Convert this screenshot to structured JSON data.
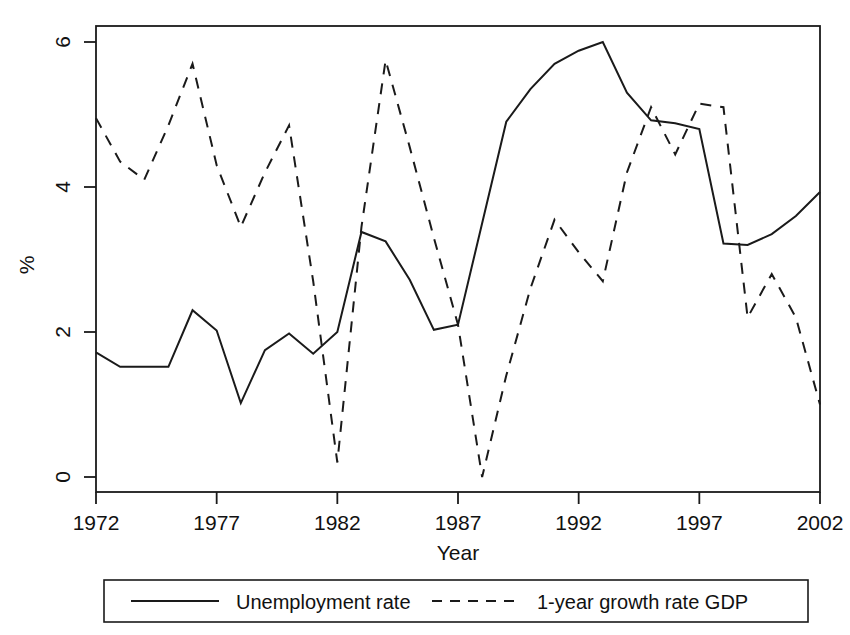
{
  "chart_data": {
    "type": "line",
    "title": "",
    "xlabel": "Year",
    "ylabel": "%",
    "xlim": [
      1972,
      2002
    ],
    "ylim": [
      0,
      6
    ],
    "grid": false,
    "legend_position": "bottom",
    "x_ticks": [
      "1972",
      "1977",
      "1982",
      "1987",
      "1992",
      "1997",
      "2002"
    ],
    "x_tick_values": [
      1972,
      1977,
      1982,
      1987,
      1992,
      1997,
      2002
    ],
    "y_ticks": [
      "0",
      "2",
      "4",
      "6"
    ],
    "y_tick_values": [
      0,
      2,
      4,
      6
    ],
    "x": [
      1972,
      1973,
      1974,
      1975,
      1976,
      1977,
      1978,
      1979,
      1980,
      1981,
      1982,
      1983,
      1984,
      1985,
      1986,
      1987,
      1988,
      1989,
      1990,
      1991,
      1992,
      1993,
      1994,
      1995,
      1996,
      1997,
      1998,
      1999,
      2000,
      2001,
      2002
    ],
    "series": [
      {
        "name": "Unemployment rate",
        "style": "solid",
        "color": "#1a1a1a",
        "values": [
          1.72,
          1.52,
          1.52,
          1.52,
          2.3,
          2.02,
          1.02,
          1.75,
          1.98,
          1.7,
          2.0,
          3.38,
          3.25,
          2.72,
          2.03,
          2.1,
          3.5,
          4.9,
          5.35,
          5.7,
          5.88,
          6.0,
          5.3,
          4.92,
          4.88,
          4.8,
          3.22,
          3.2,
          3.35,
          3.6,
          3.93
        ]
      },
      {
        "name": "1-year growth rate GDP",
        "style": "dashed",
        "color": "#1a1a1a",
        "values": [
          4.95,
          4.35,
          4.1,
          4.85,
          5.7,
          4.3,
          3.45,
          4.2,
          4.85,
          2.7,
          0.2,
          3.45,
          5.75,
          4.55,
          3.3,
          2.1,
          0.0,
          1.4,
          2.6,
          3.55,
          3.1,
          2.7,
          4.2,
          5.1,
          4.45,
          5.15,
          5.1,
          2.2,
          2.8,
          2.2,
          1.0
        ]
      }
    ]
  },
  "legend": {
    "entries": [
      {
        "label": "Unemployment rate",
        "style": "solid"
      },
      {
        "label": "1-year growth rate GDP",
        "style": "dashed"
      }
    ]
  },
  "axes": {
    "x_axis_title": "Year",
    "y_axis_title": "%"
  }
}
